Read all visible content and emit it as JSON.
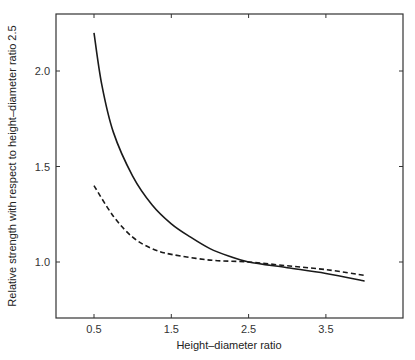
{
  "chart_data": {
    "type": "line",
    "title": "",
    "xlabel": "Height–diameter ratio",
    "ylabel": "Relative strength with respect to height–diameter ratio 2.5",
    "xlim": [
      0.05,
      4.2
    ],
    "ylim": [
      0.72,
      2.3
    ],
    "x_ticks": [
      0.5,
      1.5,
      2.5,
      3.5
    ],
    "x_tick_labels": [
      "0.5",
      "1.5",
      "2.5",
      "3.5"
    ],
    "y_ticks": [
      1.0,
      1.5,
      2.0
    ],
    "y_tick_labels": [
      "1.0",
      "1.5",
      "2.0"
    ],
    "grid": false,
    "legend": null,
    "series": [
      {
        "name": "solid",
        "style": "solid",
        "x": [
          0.5,
          0.6,
          0.75,
          1.0,
          1.25,
          1.5,
          1.75,
          2.0,
          2.25,
          2.5,
          3.0,
          3.5,
          4.0
        ],
        "values": [
          2.2,
          1.93,
          1.68,
          1.45,
          1.3,
          1.2,
          1.13,
          1.07,
          1.03,
          1.0,
          0.97,
          0.94,
          0.9
        ]
      },
      {
        "name": "dashed",
        "style": "dashed",
        "x": [
          0.5,
          0.75,
          1.0,
          1.25,
          1.5,
          2.0,
          2.5,
          3.0,
          3.5,
          4.0
        ],
        "values": [
          1.4,
          1.24,
          1.13,
          1.07,
          1.04,
          1.01,
          1.0,
          0.98,
          0.96,
          0.93
        ]
      }
    ]
  }
}
